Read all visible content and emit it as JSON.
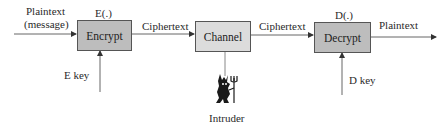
{
  "diagram": {
    "title": "",
    "nodes": {
      "encrypt": {
        "label": "Encrypt",
        "function_label": "E(.)"
      },
      "channel": {
        "label": "Channel"
      },
      "decrypt": {
        "label": "Decrypt",
        "function_label": "D(.)"
      }
    },
    "edges": {
      "input_line1": "Plaintext",
      "input_line2": "(message)",
      "enc_to_channel": "Ciphertext",
      "channel_to_dec": "Ciphertext",
      "output": "Plaintext",
      "e_key": "E key",
      "d_key": "D key"
    },
    "intruder": {
      "label": "Intruder",
      "icon": "devil-icon"
    },
    "colors": {
      "encrypt_fill": "#bdbdbd",
      "channel_fill": "#dcdcdc",
      "decrypt_fill": "#bdbdbd",
      "line": "#555555"
    }
  }
}
